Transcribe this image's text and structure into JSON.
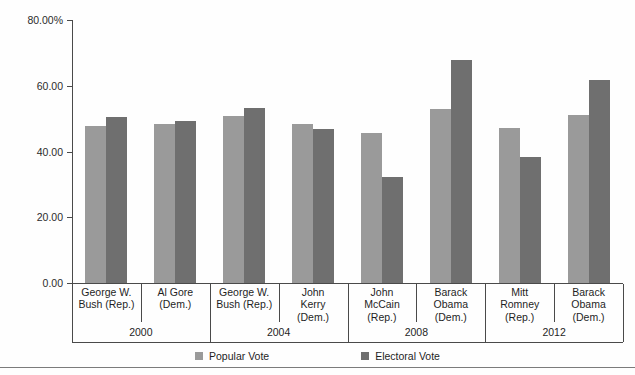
{
  "chart_data": {
    "type": "bar",
    "title": "",
    "xlabel": "",
    "ylabel": "",
    "ylim": [
      0,
      80
    ],
    "grid": false,
    "legend_position": "bottom-center",
    "y_ticks": [
      "0.00",
      "20.00",
      "40.00",
      "60.00",
      "80.00%"
    ],
    "y_tick_values": [
      0,
      20,
      40,
      60,
      80
    ],
    "categories": [
      "George W. Bush (Rep.)",
      "Al Gore (Dem.)",
      "George W. Bush (Rep.)",
      "John Kerry (Dem.)",
      "John McCain (Rep.)",
      "Barack Obama (Dem.)",
      "Mitt Romney (Rep.)",
      "Barack Obama (Dem.)"
    ],
    "groups": [
      "2000",
      "2000",
      "2004",
      "2004",
      "2008",
      "2008",
      "2012",
      "2012"
    ],
    "series": [
      {
        "name": "Popular Vote",
        "color": "#9a9a9a",
        "values": [
          47.9,
          48.4,
          50.7,
          48.3,
          45.7,
          52.9,
          47.2,
          51.1
        ]
      },
      {
        "name": "Electoral Vote",
        "color": "#6f6f6f",
        "values": [
          50.4,
          49.4,
          53.2,
          46.7,
          32.3,
          67.8,
          38.3,
          61.7
        ]
      }
    ]
  },
  "axis": {
    "y_labels": [
      {
        "text": "80.00%",
        "value": 80
      },
      {
        "text": "60.00",
        "value": 60
      },
      {
        "text": "40.00",
        "value": 40
      },
      {
        "text": "20.00",
        "value": 20
      },
      {
        "text": "0.00",
        "value": 0
      }
    ]
  },
  "candidates": [
    {
      "lines": [
        "George W.",
        "Bush (Rep.)"
      ],
      "year": "2000"
    },
    {
      "lines": [
        "Al Gore",
        "(Dem.)"
      ],
      "year": "2000"
    },
    {
      "lines": [
        "George W.",
        "Bush (Rep.)"
      ],
      "year": "2004"
    },
    {
      "lines": [
        "John",
        "Kerry",
        "(Dem.)"
      ],
      "year": "2004"
    },
    {
      "lines": [
        "John",
        "McCain",
        "(Rep.)"
      ],
      "year": "2008"
    },
    {
      "lines": [
        "Barack",
        "Obama",
        "(Dem.)"
      ],
      "year": "2008"
    },
    {
      "lines": [
        "Mitt",
        "Romney",
        "(Rep.)"
      ],
      "year": "2012"
    },
    {
      "lines": [
        "Barack",
        "Obama",
        "(Dem.)"
      ],
      "year": "2012"
    }
  ],
  "years": [
    "2000",
    "2004",
    "2008",
    "2012"
  ],
  "legend": [
    {
      "label": "Popular Vote",
      "color": "#9a9a9a"
    },
    {
      "label": "Electoral Vote",
      "color": "#6f6f6f"
    }
  ]
}
